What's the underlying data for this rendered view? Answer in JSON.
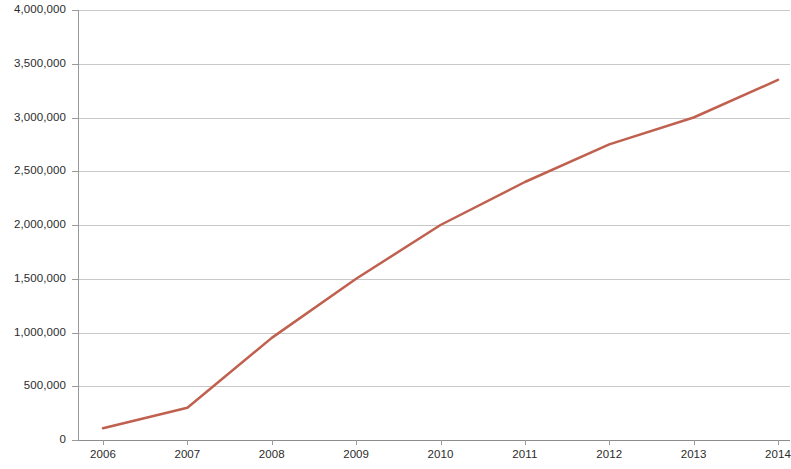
{
  "chart_data": {
    "type": "line",
    "title": "",
    "subtitle": "",
    "xlabel": "",
    "ylabel": "",
    "categories": [
      "2006",
      "2007",
      "2008",
      "2009",
      "2010",
      "2011",
      "2012",
      "2013",
      "2014"
    ],
    "x": [
      2006,
      2007,
      2008,
      2009,
      2010,
      2011,
      2012,
      2013,
      2014
    ],
    "series": [
      {
        "name": "Series 1",
        "color": "#c0604f",
        "values": [
          110000,
          300000,
          950000,
          1500000,
          2000000,
          2400000,
          2750000,
          3000000,
          3350000
        ]
      }
    ],
    "ylim": [
      0,
      4000000
    ],
    "y_ticks": [
      0,
      500000,
      1000000,
      1500000,
      2000000,
      2500000,
      3000000,
      3500000,
      4000000
    ],
    "y_tick_labels": [
      "0",
      "500,000",
      "1,000,000",
      "1,500,000",
      "2,000,000",
      "2,500,000",
      "3,000,000",
      "3,500,000",
      "4,000,000"
    ],
    "x_tick_labels": [
      "2006",
      "2007",
      "2008",
      "2009",
      "2010",
      "2011",
      "2012",
      "2013",
      "2014"
    ],
    "grid": true,
    "grid_axis": "y",
    "legend": false,
    "legend_position": "none",
    "line_width": 2.5,
    "markers": false,
    "annotations": [],
    "colors": {
      "series_1": "#c0604f",
      "gridline": "#c8c8c8",
      "axis": "#9a9a9a",
      "tick_text": "#2b2b2b",
      "background": "#ffffff"
    }
  }
}
